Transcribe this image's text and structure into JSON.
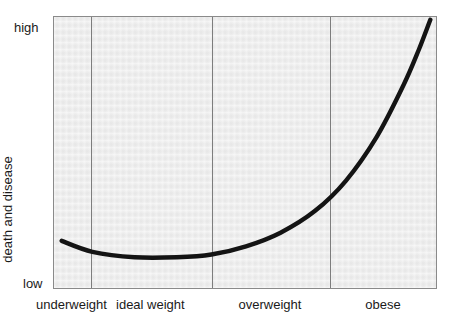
{
  "chart_data": {
    "type": "line",
    "title": "",
    "subtitle": "",
    "xlabel": "",
    "ylabel": "Risk of premature death and disease",
    "ylabel_lines": [
      "Risk of premature",
      "death and disease"
    ],
    "categories": [
      "underweight",
      "ideal weight",
      "overweight",
      "obese"
    ],
    "y_tick_labels": [
      "low",
      "high"
    ],
    "ylim_labels": {
      "min": "low",
      "max": "high"
    },
    "grid": false,
    "legend": "none",
    "annotations": [],
    "series": [
      {
        "name": "Risk of premature death and disease",
        "color": "#141414",
        "points": [
          {
            "x": 0.02,
            "y": 0.18
          },
          {
            "x": 0.1,
            "y": 0.14
          },
          {
            "x": 0.21,
            "y": 0.12
          },
          {
            "x": 0.32,
            "y": 0.12
          },
          {
            "x": 0.41,
            "y": 0.13
          },
          {
            "x": 0.5,
            "y": 0.16
          },
          {
            "x": 0.59,
            "y": 0.21
          },
          {
            "x": 0.68,
            "y": 0.29
          },
          {
            "x": 0.76,
            "y": 0.4
          },
          {
            "x": 0.84,
            "y": 0.56
          },
          {
            "x": 0.91,
            "y": 0.75
          },
          {
            "x": 0.95,
            "y": 0.88
          },
          {
            "x": 0.98,
            "y": 0.99
          }
        ]
      }
    ],
    "band_boundaries": [
      0.0,
      0.096,
      0.411,
      0.719,
      1.0
    ]
  },
  "colors": {
    "panel_background": "#ebebeb",
    "panel_border": "#8a8a8a",
    "divider": "#7d7d7d",
    "curve": "#141414",
    "text": "#1a1a1a",
    "page_background": "#ffffff"
  }
}
